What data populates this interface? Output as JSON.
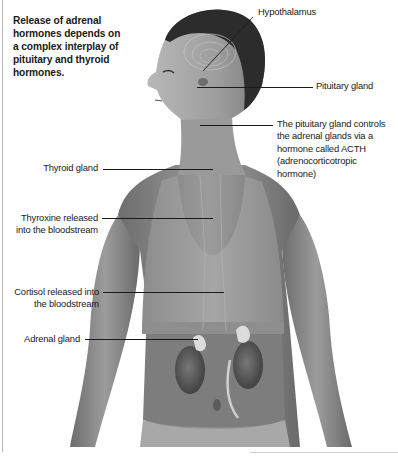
{
  "diagram": {
    "intro_text": "Release of adrenal hormones depends on a complex interplay of pituitary and thyroid hormones.",
    "labels": [
      {
        "id": "hypothalamus",
        "text": "Hypothalamus"
      },
      {
        "id": "pituitary",
        "text": "Pituitary gland"
      },
      {
        "id": "acth",
        "lines": [
          "The pituitary gland controls",
          "the adrenal glands via a",
          "hormone called ACTH",
          "(adrenocorticotropic hormone)"
        ]
      },
      {
        "id": "thyroid",
        "text": "Thyroid gland"
      },
      {
        "id": "thyroxine",
        "lines": [
          "Thyroxine released",
          "into the bloodstream"
        ]
      },
      {
        "id": "cortisol",
        "lines": [
          "Cortisol released into",
          "the bloodstream"
        ]
      },
      {
        "id": "adrenal",
        "text": "Adrenal gland"
      }
    ],
    "colors": {
      "background": "#ffffff",
      "text": "#1a1a1a",
      "skin": "#8a8a8a",
      "hair": "#2a2a2a",
      "top": "#9a9a9a",
      "kidney": "#555555",
      "adrenal": "#d8d8d8"
    }
  }
}
